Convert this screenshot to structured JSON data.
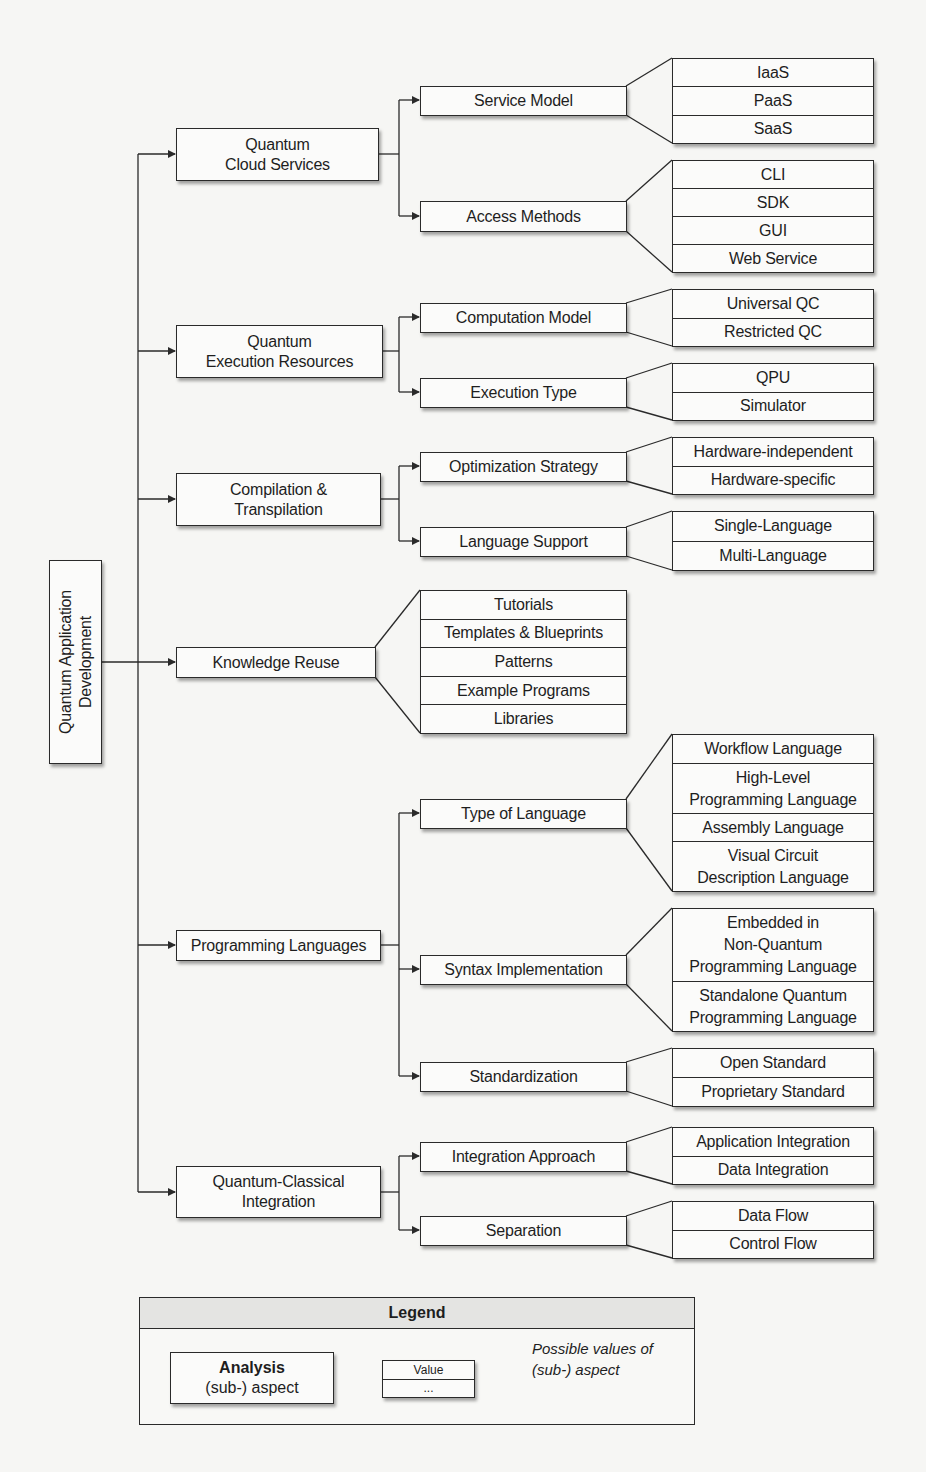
{
  "diagram": {
    "root": {
      "label": "Quantum Application\nDevelopment"
    },
    "aspects": [
      {
        "label": "Quantum\nCloud Services",
        "sub_aspects": [
          {
            "label": "Service Model",
            "values": [
              "IaaS",
              "PaaS",
              "SaaS"
            ]
          },
          {
            "label": "Access Methods",
            "values": [
              "CLI",
              "SDK",
              "GUI",
              "Web Service"
            ]
          }
        ]
      },
      {
        "label": "Quantum\nExecution Resources",
        "sub_aspects": [
          {
            "label": "Computation Model",
            "values": [
              "Universal QC",
              "Restricted QC"
            ]
          },
          {
            "label": "Execution Type",
            "values": [
              "QPU",
              "Simulator"
            ]
          }
        ]
      },
      {
        "label": "Compilation &\nTranspilation",
        "sub_aspects": [
          {
            "label": "Optimization Strategy",
            "values": [
              "Hardware-independent",
              "Hardware-specific"
            ]
          },
          {
            "label": "Language Support",
            "values": [
              "Single-Language",
              "Multi-Language"
            ]
          }
        ]
      },
      {
        "label": "Knowledge Reuse",
        "values": [
          "Tutorials",
          "Templates & Blueprints",
          "Patterns",
          "Example Programs",
          "Libraries"
        ]
      },
      {
        "label": "Programming Languages",
        "sub_aspects": [
          {
            "label": "Type of Language",
            "values": [
              "Workflow Language",
              "High-Level\nProgramming Language",
              "Assembly Language",
              "Visual Circuit\nDescription Language"
            ]
          },
          {
            "label": "Syntax Implementation",
            "values": [
              "Embedded in\nNon-Quantum\nProgramming Language",
              "Standalone Quantum\nProgramming Language"
            ]
          },
          {
            "label": "Standardization",
            "values": [
              "Open Standard",
              "Proprietary Standard"
            ]
          }
        ]
      },
      {
        "label": "Quantum-Classical\nIntegration",
        "sub_aspects": [
          {
            "label": "Integration Approach",
            "values": [
              "Application Integration",
              "Data Integration"
            ]
          },
          {
            "label": "Separation",
            "values": [
              "Data Flow",
              "Control Flow"
            ]
          }
        ]
      }
    ],
    "legend": {
      "title": "Legend",
      "analysis_bold": "Analysis",
      "analysis_sub": "(sub-) aspect",
      "value_example": "Value",
      "value_more": "...",
      "note": "Possible values of\n(sub-) aspect"
    }
  },
  "colors": {
    "line": "#2a2a2a",
    "box_fill": "#fbfbfa",
    "legend_title_fill": "#e4e4e2",
    "page": "#f6f6f4"
  }
}
